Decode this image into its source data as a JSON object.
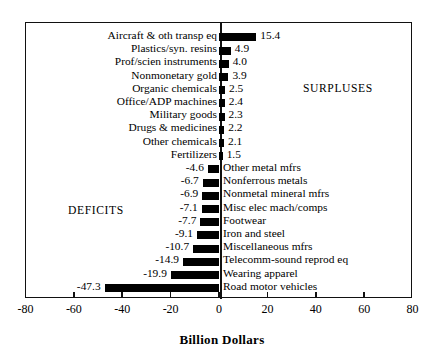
{
  "chart_data": {
    "type": "bar",
    "orientation": "horizontal",
    "title": "",
    "xlabel": "Billion Dollars",
    "ylabel": "",
    "xlim": [
      -80,
      80
    ],
    "xticks": [
      -80,
      -60,
      -40,
      -20,
      0,
      20,
      40,
      60,
      80
    ],
    "xtick_labels": [
      "-80",
      "-60",
      "-40",
      "-20",
      "0",
      "20",
      "40",
      "60",
      "80"
    ],
    "grid": false,
    "legend": null,
    "annotations": [
      {
        "text": "SURPLUSES",
        "x": 45,
        "side": "right"
      },
      {
        "text": "DEFICITS",
        "x": -52,
        "side": "left"
      }
    ],
    "categories": [
      "Aircraft & oth transp eq",
      "Plastics/syn. resins",
      "Prof/scien instruments",
      "Nonmonetary gold",
      "Organic chemicals",
      "Office/ADP machines",
      "Military goods",
      "Drugs & medicines",
      "Other chemicals",
      "Fertilizers",
      "Other metal mfrs",
      "Nonferrous metals",
      "Nonmetal mineral mfrs",
      "Misc elec mach/comps",
      "Footwear",
      "Iron and steel",
      "Miscellaneous mfrs",
      "Telecomm-sound reprod eq",
      "Wearing apparel",
      "Road motor vehicles"
    ],
    "values": [
      15.4,
      4.9,
      4.0,
      3.9,
      2.5,
      2.4,
      2.3,
      2.2,
      2.1,
      1.5,
      -4.6,
      -6.7,
      -6.9,
      -7.1,
      -7.7,
      -9.1,
      -10.7,
      -14.9,
      -19.9,
      -47.3
    ],
    "value_labels": [
      "15.4",
      "4.9",
      "4.0",
      "3.9",
      "2.5",
      "2.4",
      "2.3",
      "2.2",
      "2.1",
      "1.5",
      "-4.6",
      "-6.7",
      "-6.9",
      "-7.1",
      "-7.7",
      "-9.1",
      "-10.7",
      "-14.9",
      "-19.9",
      "-47.3"
    ],
    "bar_color": "#000000"
  },
  "axis": {
    "title": "Billion Dollars"
  }
}
